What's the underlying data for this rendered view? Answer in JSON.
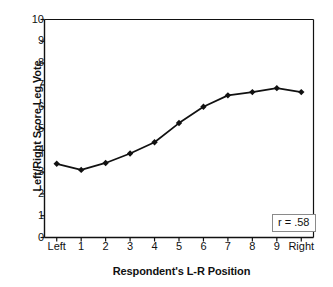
{
  "chart_data": {
    "type": "line",
    "title": "",
    "xlabel": "Respondent's L-R Position",
    "ylabel": "Left/Right Score Leg Vote",
    "categories": [
      "Left",
      "1",
      "2",
      "3",
      "4",
      "5",
      "6",
      "7",
      "8",
      "9",
      "Right"
    ],
    "values": [
      3.38,
      3.1,
      3.42,
      3.85,
      4.37,
      5.25,
      6.0,
      6.52,
      6.67,
      6.85,
      6.67
    ],
    "series": [
      {
        "name": "Left/Right Score Leg Vote",
        "values": [
          3.38,
          3.1,
          3.42,
          3.85,
          4.37,
          5.25,
          6.0,
          6.52,
          6.67,
          6.85,
          6.67
        ]
      }
    ],
    "ylim": [
      0,
      10
    ],
    "y_ticks": [
      0,
      1,
      2,
      3,
      4,
      5,
      6,
      7,
      8,
      9,
      10
    ],
    "y_tick_labels": [
      "0",
      "1",
      "2",
      "3",
      "4",
      "5",
      "6",
      "7",
      "8",
      "9",
      "10"
    ],
    "x_tick_labels": [
      "Left",
      "1",
      "2",
      "3",
      "4",
      "5",
      "6",
      "7",
      "8",
      "9",
      "Right"
    ],
    "grid": false,
    "legend": null,
    "legend_position": "none",
    "marker": "diamond",
    "line_color": "#111111",
    "marker_color": "#111111",
    "annotations": [
      {
        "text": "r = .58",
        "position": "bottom-right",
        "boxed": true,
        "border_color": "#8a8a8a"
      }
    ]
  },
  "annotation": {
    "r_value_label": "r = .58"
  },
  "axes": {
    "x_title": "Respondent's L-R Position",
    "y_title": "Left/Right Score Leg Vote"
  }
}
